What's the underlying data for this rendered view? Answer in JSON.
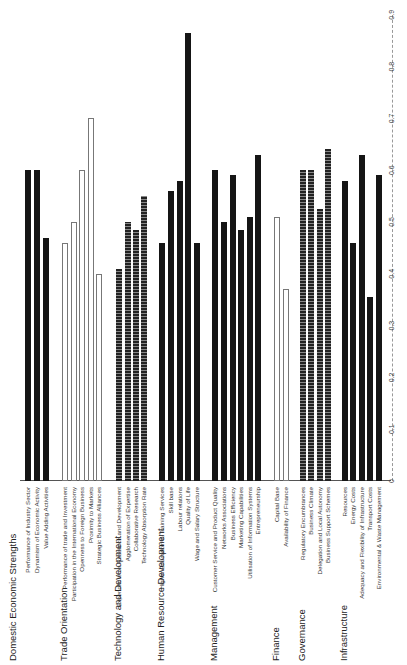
{
  "chart_data": {
    "type": "bar",
    "orientation": "rotated page (horizontal bar chart printed landscape, rendered 90deg counter-clockwise)",
    "title": "",
    "xlabel": "",
    "ylabel": "",
    "ylim": [
      0,
      0.9
    ],
    "ticks": [
      "0",
      "0.1",
      "0.2",
      "0.3",
      "0.4",
      "0.5",
      "0.6",
      "0.7",
      "0.8",
      "0.9"
    ],
    "grid": false,
    "groups": [
      {
        "name": "Domestic Economic Strengths",
        "style": "solid",
        "items": [
          {
            "label": "Performance of Industry Sector",
            "value": 0.6
          },
          {
            "label": "Dynamism of Economic Activity",
            "value": 0.6
          },
          {
            "label": "Value Adding Activities",
            "value": 0.47
          }
        ]
      },
      {
        "name": "Trade Orientation",
        "style": "open",
        "items": [
          {
            "label": "Performance of trade and Investment",
            "value": 0.46
          },
          {
            "label": "Participation in the International Economy",
            "value": 0.5
          },
          {
            "label": "Openness to Foreign Business",
            "value": 0.6
          },
          {
            "label": "Proximity to Markets",
            "value": 0.7
          },
          {
            "label": "Strategic Business Alliances",
            "value": 0.4
          }
        ]
      },
      {
        "name": "Technology and Development",
        "style": "hatch",
        "items": [
          {
            "label": "Expenditure on Research and Development",
            "value": 0.41
          },
          {
            "label": "Agglomeration of Expertise",
            "value": 0.5
          },
          {
            "label": "Collaborative Research",
            "value": 0.485
          },
          {
            "label": "Technology Absorption Rate",
            "value": 0.55
          }
        ]
      },
      {
        "name": "Human Resource Development",
        "style": "solid",
        "items": [
          {
            "label": "Higher Education & Training Services",
            "value": 0.46
          },
          {
            "label": "Skill base",
            "value": 0.56
          },
          {
            "label": "Labour relations",
            "value": 0.58
          },
          {
            "label": "Quality of Life",
            "value": 0.865
          },
          {
            "label": "Wage and Salary Structure",
            "value": 0.46
          }
        ]
      },
      {
        "name": "Management",
        "style": "solid",
        "items": [
          {
            "label": "Customer Service and Product Quality",
            "value": 0.6
          },
          {
            "label": "Networks Associations",
            "value": 0.5
          },
          {
            "label": "Business Efficiency",
            "value": 0.59
          },
          {
            "label": "Marketing Capabilities",
            "value": 0.485
          },
          {
            "label": "Utilisation of Information Systems",
            "value": 0.51
          },
          {
            "label": "Entrepreneurship",
            "value": 0.63
          }
        ]
      },
      {
        "name": "Finance",
        "style": "open",
        "items": [
          {
            "label": "Capital Base",
            "value": 0.51
          },
          {
            "label": "Availability of Finance",
            "value": 0.37
          }
        ]
      },
      {
        "name": "Governance",
        "style": "hatch",
        "items": [
          {
            "label": "Regulatory Encumbrances",
            "value": 0.6
          },
          {
            "label": "Business Climate",
            "value": 0.6
          },
          {
            "label": "Delegation and Local Autonomy",
            "value": 0.525
          },
          {
            "label": "Business Support Schemes",
            "value": 0.64
          }
        ]
      },
      {
        "name": "Infrastructure",
        "style": "solid",
        "items": [
          {
            "label": "Resources",
            "value": 0.58
          },
          {
            "label": "Energy Costs",
            "value": 0.46
          },
          {
            "label": "Adequacy and Flexibility of Infrastructure",
            "value": 0.63
          },
          {
            "label": "Transport Costs",
            "value": 0.355
          },
          {
            "label": "Environmental & Waste Management",
            "value": 0.59
          }
        ]
      }
    ]
  },
  "layout": {
    "group_label_pos": [
      13,
      64,
      118,
      161,
      214,
      276,
      302,
      344
    ],
    "bar_pos": [
      [
        28,
        37,
        46
      ],
      [
        65,
        74,
        82,
        91,
        99
      ],
      [
        119,
        128,
        136,
        144
      ],
      [
        162,
        171,
        180,
        188,
        197
      ],
      [
        215,
        224,
        233,
        241,
        250,
        258
      ],
      [
        277,
        286
      ],
      [
        303,
        311,
        320,
        328
      ],
      [
        345,
        353,
        362,
        370,
        379
      ]
    ]
  }
}
